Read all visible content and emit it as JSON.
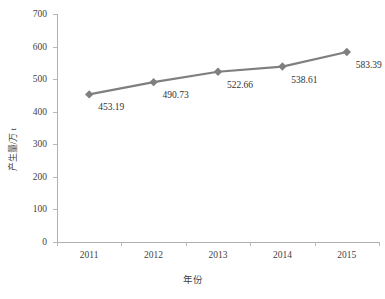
{
  "chart_data": {
    "type": "line",
    "title": "",
    "xlabel": "年份",
    "ylabel": "产生量/万 t",
    "categories": [
      "2011",
      "2012",
      "2013",
      "2014",
      "2015"
    ],
    "values": [
      453.19,
      490.73,
      522.66,
      538.61,
      583.39
    ],
    "point_labels": [
      "453.19",
      "490.73",
      "522.66",
      "538.61",
      "583.39"
    ],
    "ylim": [
      0,
      700
    ],
    "ytick_step": 100,
    "ytick_labels": [
      "700",
      "600",
      "500",
      "400",
      "300",
      "200",
      "100",
      "0"
    ],
    "ytick_values": [
      700,
      600,
      500,
      400,
      300,
      200,
      100,
      0
    ],
    "grid": false,
    "legend": false,
    "legend_position": "none",
    "series_color": "#7f7f7f",
    "marker": "diamond",
    "axis_color": "#b0b0b0",
    "background": "#ffffff",
    "text_color": "#3f3f3f"
  }
}
